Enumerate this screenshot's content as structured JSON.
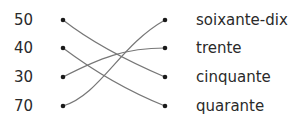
{
  "left_items": [
    {
      "label": "50",
      "y": 20
    },
    {
      "label": "40",
      "y": 48
    },
    {
      "label": "30",
      "y": 77
    },
    {
      "label": "70",
      "y": 106
    }
  ],
  "right_items": [
    {
      "label": "soixante-dix",
      "y": 20
    },
    {
      "label": "trente",
      "y": 48
    },
    {
      "label": "cinquante",
      "y": 77
    },
    {
      "label": "quarante",
      "y": 106
    }
  ],
  "connections": [
    {
      "from": "50",
      "to": "cinquante"
    },
    {
      "from": "40",
      "to": "quarante"
    },
    {
      "from": "30",
      "to": "trente"
    },
    {
      "from": "70",
      "to": "soixante-dix"
    }
  ],
  "colors": {
    "line": "#777777",
    "dot": "#1a1a1a",
    "text": "#2a2a2a"
  }
}
